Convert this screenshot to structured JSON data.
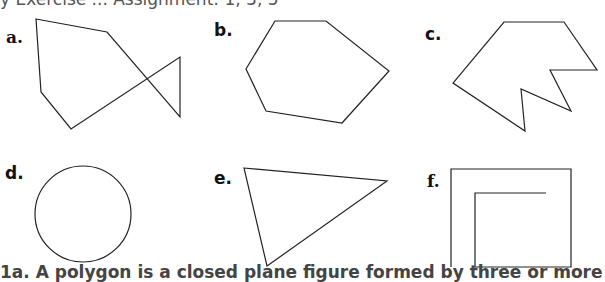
{
  "header": {
    "clipped_text": "y  Exercise ... Assignment: 1, 3, 5"
  },
  "figures": [
    {
      "label": "a.",
      "shape": "self-intersecting polygon (fish shape)"
    },
    {
      "label": "b.",
      "shape": "convex hexagon"
    },
    {
      "label": "c.",
      "shape": "concave polygon"
    },
    {
      "label": "d.",
      "shape": "circle"
    },
    {
      "label": "e.",
      "shape": "triangle"
    },
    {
      "label": "f.",
      "shape": "open spiral of line segments"
    }
  ],
  "footer": {
    "clipped_text": "1a.   A polygon is a closed plane figure formed by three or more"
  }
}
